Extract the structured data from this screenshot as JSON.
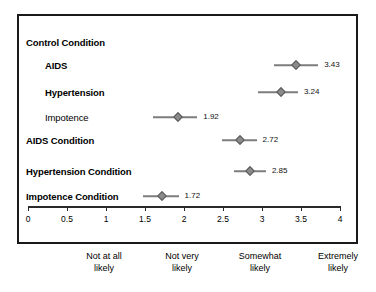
{
  "chart_data": {
    "type": "scatter",
    "title": "",
    "xlabel": "",
    "ylabel": "",
    "xlim": [
      0,
      4
    ],
    "grid": false,
    "legend": null,
    "orientation": "horizontal",
    "marker": "diamond",
    "error_bars": true,
    "axis": {
      "ticks": [
        0,
        0.5,
        1,
        1.5,
        2,
        2.5,
        3,
        3.5,
        4
      ],
      "tick_labels": [
        "0",
        "0.5",
        "1",
        "1.5",
        "2",
        "2.5",
        "3",
        "3.5",
        "4"
      ]
    },
    "anchor_labels": [
      {
        "value": 1,
        "line1": "Not at all",
        "line2": "likely"
      },
      {
        "value": 2,
        "line1": "Not very",
        "line2": "likely"
      },
      {
        "value": 3,
        "line1": "Somewhat",
        "line2": "likely"
      },
      {
        "value": 4,
        "line1": "Extremely",
        "line2": "likely"
      }
    ],
    "rows": [
      {
        "label": "Control Condition",
        "level": 0,
        "bold": true,
        "value": null,
        "value_text": "",
        "ci_low": null,
        "ci_high": null
      },
      {
        "label": "AIDS",
        "level": 1,
        "bold": true,
        "value": 3.43,
        "value_text": "3.43",
        "ci_low": 3.15,
        "ci_high": 3.72
      },
      {
        "label": "Hypertension",
        "level": 1,
        "bold": true,
        "value": 3.24,
        "value_text": "3.24",
        "ci_low": 2.95,
        "ci_high": 3.46
      },
      {
        "label": "Impotence",
        "level": 1,
        "bold": false,
        "value": 1.92,
        "value_text": "1.92",
        "ci_low": 1.6,
        "ci_high": 2.17
      },
      {
        "label": "AIDS Condition",
        "level": 0,
        "bold": true,
        "value": 2.72,
        "value_text": "2.72",
        "ci_low": 2.49,
        "ci_high": 2.93
      },
      {
        "label": "Hypertension Condition",
        "level": 0,
        "bold": true,
        "value": 2.85,
        "value_text": "2.85",
        "ci_low": 2.64,
        "ci_high": 3.05
      },
      {
        "label": "Impotence Condition",
        "level": 0,
        "bold": true,
        "value": 1.72,
        "value_text": "1.72",
        "ci_low": 1.48,
        "ci_high": 1.93
      }
    ],
    "colors": {
      "marker": "#8a8a8a",
      "marker_edge": "#5a5a5a",
      "error_bar": "#7d7d7d",
      "axis": "#2a2a2a",
      "border": "#1a1a1a",
      "background": "#ffffff",
      "text": "#000000"
    }
  },
  "layout": {
    "row_y": [
      26,
      49,
      76,
      101,
      124,
      155,
      180
    ]
  }
}
